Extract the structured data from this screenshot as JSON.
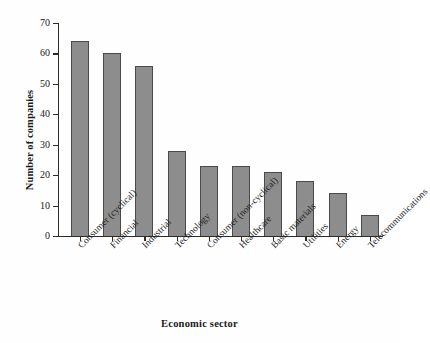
{
  "chart_data": {
    "type": "bar",
    "title": "",
    "subtitle": "",
    "xlabel": "Economic sector",
    "ylabel": "Number of companies",
    "categories": [
      "Consumer (cyclical)",
      "Financial",
      "Industrial",
      "Technology",
      "Consumer (non-cyclical)",
      "Healthcare",
      "Basic materials",
      "Utilities",
      "Energy",
      "Telecommunications"
    ],
    "values": [
      64,
      60,
      56,
      28,
      23,
      23,
      21,
      18,
      14,
      7
    ],
    "ylim": [
      0,
      70
    ],
    "ytick_labels": [
      "0",
      "10",
      "20",
      "30",
      "40",
      "50",
      "60",
      "70"
    ],
    "ytick_values": [
      0,
      10,
      20,
      30,
      40,
      50,
      60,
      70
    ],
    "grid": false,
    "legend": false,
    "legend_position": "none",
    "bar_fill_color": "#8d8d8d",
    "bar_border_color": "#4a4a4a",
    "axis_color": "#2b2b2b",
    "background_color": "#fefefe",
    "category_label_rotation_deg": -45
  }
}
